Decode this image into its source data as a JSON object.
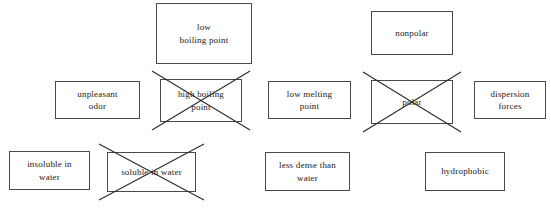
{
  "diagram": {
    "background_color": "#ffffff",
    "box_border_color": "#4a4a4a",
    "strike_color": "#2b2b2b",
    "boxes": [
      {
        "id": "low-boiling-point",
        "label": "low\nboiling point",
        "crossed_out": false,
        "x": 156,
        "y": 3,
        "w": 96,
        "h": 61
      },
      {
        "id": "nonpolar",
        "label": "nonpolar",
        "crossed_out": false,
        "x": 371,
        "y": 11,
        "w": 82,
        "h": 44
      },
      {
        "id": "unpleasant-odor",
        "label": "unpleasant\nodor",
        "crossed_out": false,
        "x": 55,
        "y": 81,
        "w": 85,
        "h": 38
      },
      {
        "id": "high-boiling-point",
        "label": "high boiling\npoint",
        "crossed_out": true,
        "x": 160,
        "y": 79,
        "w": 82,
        "h": 43
      },
      {
        "id": "low-melting-point",
        "label": "low melting\npoint",
        "crossed_out": false,
        "x": 268,
        "y": 81,
        "w": 83,
        "h": 38
      },
      {
        "id": "polar",
        "label": "polar",
        "crossed_out": true,
        "x": 371,
        "y": 80,
        "w": 82,
        "h": 44
      },
      {
        "id": "dispersion-forces",
        "label": "dispersion\nforces",
        "crossed_out": false,
        "x": 474,
        "y": 81,
        "w": 72,
        "h": 38
      },
      {
        "id": "insoluble-in-water",
        "label": "insoluble in\nwater",
        "crossed_out": false,
        "x": 9,
        "y": 151,
        "w": 81,
        "h": 39
      },
      {
        "id": "soluble-in-water",
        "label": "soluble in water",
        "crossed_out": true,
        "x": 107,
        "y": 152,
        "w": 89,
        "h": 40
      },
      {
        "id": "less-dense-than-water",
        "label": "less dense than\nwater",
        "crossed_out": false,
        "x": 265,
        "y": 152,
        "w": 85,
        "h": 39
      },
      {
        "id": "hydrophobic",
        "label": "hydrophobic",
        "crossed_out": false,
        "x": 425,
        "y": 152,
        "w": 80,
        "h": 39
      }
    ]
  }
}
